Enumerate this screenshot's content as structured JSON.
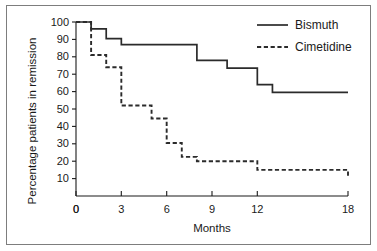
{
  "chart_data": {
    "type": "line",
    "title": "",
    "subtitle": "",
    "xlabel": "Months",
    "ylabel": "Percentage patients in remission",
    "xlim": [
      0,
      18
    ],
    "ylim": [
      0,
      100
    ],
    "xticks": [
      0,
      3,
      6,
      9,
      12,
      18
    ],
    "xtick_labels": [
      "0",
      "3",
      "6",
      "9",
      "12",
      "18"
    ],
    "yticks": [
      0,
      10,
      20,
      30,
      40,
      50,
      60,
      70,
      80,
      90,
      100
    ],
    "ytick_labels": [
      "0",
      "10",
      "20",
      "30",
      "40",
      "50",
      "60",
      "70",
      "80",
      "90",
      "100"
    ],
    "grid": false,
    "legend_position": "top-right",
    "style": "kaplan-meier step survival curves",
    "series": [
      {
        "name": "Bismuth",
        "line_style": "solid",
        "color": "#2b2b2b",
        "points": [
          {
            "x": 0,
            "y": 100
          },
          {
            "x": 1,
            "y": 100
          },
          {
            "x": 1,
            "y": 96
          },
          {
            "x": 2,
            "y": 96
          },
          {
            "x": 2,
            "y": 90.5
          },
          {
            "x": 3,
            "y": 90.5
          },
          {
            "x": 3,
            "y": 87
          },
          {
            "x": 8,
            "y": 87
          },
          {
            "x": 8,
            "y": 78
          },
          {
            "x": 10,
            "y": 78
          },
          {
            "x": 10,
            "y": 73.5
          },
          {
            "x": 12,
            "y": 73.5
          },
          {
            "x": 12,
            "y": 64
          },
          {
            "x": 13,
            "y": 64
          },
          {
            "x": 13,
            "y": 59.5
          },
          {
            "x": 18,
            "y": 59.5
          }
        ]
      },
      {
        "name": "Cimetidine",
        "line_style": "dashed",
        "color": "#2b2b2b",
        "points": [
          {
            "x": 0,
            "y": 100
          },
          {
            "x": 1,
            "y": 100
          },
          {
            "x": 1,
            "y": 81
          },
          {
            "x": 2,
            "y": 81
          },
          {
            "x": 2,
            "y": 74
          },
          {
            "x": 3,
            "y": 74
          },
          {
            "x": 3,
            "y": 52
          },
          {
            "x": 5,
            "y": 52
          },
          {
            "x": 5,
            "y": 44.5
          },
          {
            "x": 6,
            "y": 44.5
          },
          {
            "x": 6,
            "y": 30.5
          },
          {
            "x": 7,
            "y": 30.5
          },
          {
            "x": 7,
            "y": 22.5
          },
          {
            "x": 8,
            "y": 22.5
          },
          {
            "x": 8,
            "y": 20
          },
          {
            "x": 12,
            "y": 20
          },
          {
            "x": 12,
            "y": 15
          },
          {
            "x": 18,
            "y": 15
          },
          {
            "x": 18,
            "y": 11
          }
        ]
      }
    ]
  },
  "legend": {
    "items": [
      {
        "label": "Bismuth",
        "style": "solid"
      },
      {
        "label": "Cimetidine",
        "style": "dashed"
      }
    ]
  },
  "axes": {
    "x_title": "Months",
    "y_title": "Percentage patients in remission"
  }
}
